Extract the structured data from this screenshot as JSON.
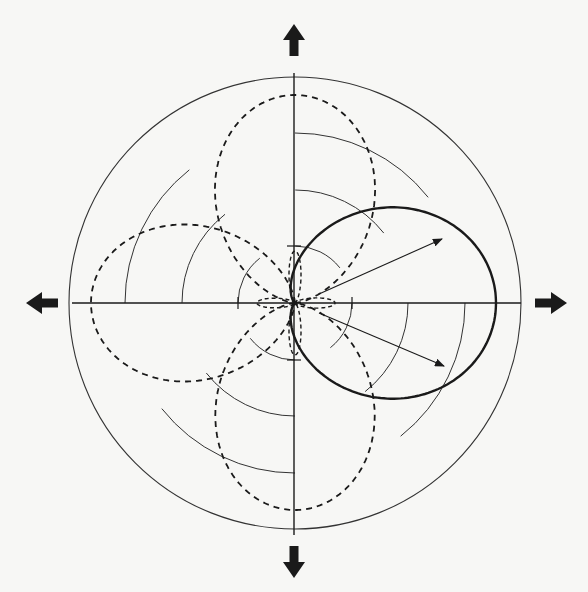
{
  "figure": {
    "type": "polar radiation-pattern diagram",
    "center": [
      295,
      303
    ],
    "colors": {
      "ink": "#1a1a1a",
      "grid": "#333333",
      "paper": "#f7f7f5"
    },
    "grid_circles": {
      "radii": [
        57,
        113,
        170,
        226
      ],
      "style": "thin solid, broken where crossed by dashed lobes"
    },
    "axes": {
      "horizontal": {
        "from": 72,
        "to": 521
      },
      "vertical": {
        "from": 73,
        "to": 535
      },
      "ticks": [
        {
          "axis": "x",
          "offset": -57
        },
        {
          "axis": "x",
          "offset": 57
        },
        {
          "axis": "y",
          "offset": -57
        },
        {
          "axis": "y",
          "offset": 57
        }
      ]
    },
    "direction_arrows": [
      {
        "name": "arrow-up",
        "direction": "up",
        "tip": [
          294,
          24
        ]
      },
      {
        "name": "arrow-right",
        "direction": "right",
        "tip": [
          567,
          303
        ]
      },
      {
        "name": "arrow-down",
        "direction": "down",
        "tip": [
          294,
          578
        ]
      },
      {
        "name": "arrow-left",
        "direction": "left",
        "tip": [
          26,
          303
        ]
      }
    ],
    "solid_pattern": {
      "description": "cardioid-like main lobe pointing right",
      "formula": "r = R * ((1 + cos(theta)) / 2)^n",
      "R": 201,
      "n": 2.5,
      "direction_deg": 0,
      "stroke_width": 2.4
    },
    "dashed_lobes": [
      {
        "name": "lobe-up",
        "direction_deg": 90,
        "R": 208,
        "stroke_width": 1.8
      },
      {
        "name": "lobe-left",
        "direction_deg": 180,
        "R": 204,
        "stroke_width": 1.8
      },
      {
        "name": "lobe-down",
        "direction_deg": 270,
        "R": 207,
        "stroke_width": 1.8
      },
      {
        "name": "minor-lobe-right",
        "direction_deg": 0,
        "R": 40,
        "width_scale": 0.33,
        "stroke_width": 1.4
      },
      {
        "name": "minor-lobe-left",
        "direction_deg": 180,
        "R": 38,
        "width_scale": 0.33,
        "stroke_width": 1.4
      },
      {
        "name": "minor-lobe-up",
        "direction_deg": 90,
        "R": 52,
        "width_scale": 0.3,
        "stroke_width": 1.4
      },
      {
        "name": "minor-lobe-down",
        "direction_deg": 270,
        "R": 52,
        "width_scale": 0.3,
        "stroke_width": 1.4
      }
    ],
    "vector_arrows": [
      {
        "name": "vector-upper",
        "from": [
          319,
          294
        ],
        "to": [
          442,
          239
        ]
      },
      {
        "name": "vector-lower",
        "from": [
          319,
          313
        ],
        "to": [
          444,
          366
        ]
      }
    ]
  }
}
